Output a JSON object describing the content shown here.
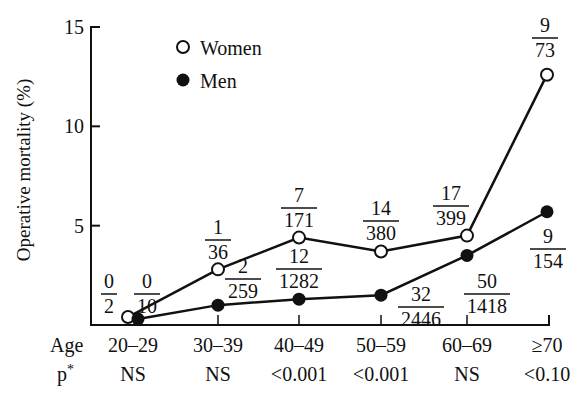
{
  "chart_data": {
    "type": "line",
    "title": "",
    "xlabel": "Age",
    "ylabel": "Operative mortality (%)",
    "ylim": [
      0,
      15
    ],
    "yticks": [
      5,
      10,
      15
    ],
    "grid": false,
    "legend_position": "upper-left (inside)",
    "categories": [
      "20–29",
      "30–39",
      "40–49",
      "50–59",
      "60–69",
      "≥70"
    ],
    "p_values": [
      "NS",
      "NS",
      "<0.001",
      "<0.001",
      "NS",
      "<0.10"
    ],
    "row_labels": {
      "age": "Age",
      "p": "p*"
    },
    "series": [
      {
        "name": "Women",
        "marker": "open-circle",
        "values": [
          0.4,
          2.8,
          4.4,
          3.7,
          4.5,
          12.6
        ],
        "fractions": [
          {
            "num": "0",
            "den": "2"
          },
          {
            "num": "1",
            "den": "36"
          },
          {
            "num": "7",
            "den": "171"
          },
          {
            "num": "14",
            "den": "380"
          },
          {
            "num": "17",
            "den": "399"
          },
          {
            "num": "9",
            "den": "73"
          }
        ]
      },
      {
        "name": "Men",
        "marker": "filled-circle",
        "values": [
          0.3,
          1.0,
          1.3,
          1.5,
          3.5,
          5.7
        ],
        "fractions": [
          {
            "num": "0",
            "den": "10"
          },
          {
            "num": "2",
            "den": "259"
          },
          {
            "num": "12",
            "den": "1282"
          },
          {
            "num": "32",
            "den": "2446"
          },
          {
            "num": "50",
            "den": "1418"
          },
          {
            "num": "9",
            "den": "154"
          }
        ]
      }
    ]
  },
  "legend": {
    "women": "Women",
    "men": "Men"
  },
  "colors": {
    "ink": "#111111",
    "background": "#ffffff"
  }
}
